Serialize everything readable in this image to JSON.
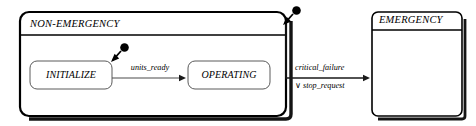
{
  "diagram": {
    "kind": "statechart",
    "background": "#ffffff",
    "line_color": "#000000",
    "shadow_color": "#1a1a1a",
    "states": [
      {
        "id": "non-emergency",
        "name": "NON-EMERGENCY",
        "kind": "composite",
        "x": 20,
        "y": 12,
        "width": 266,
        "height": 104,
        "corner_radius": 9,
        "title_divider_y": 35,
        "shadow": true,
        "border_width": 2.2
      },
      {
        "id": "initialize",
        "name": "INITIALIZE",
        "kind": "simple",
        "x": 30,
        "y": 61,
        "width": 82,
        "height": 28,
        "corner_radius": 7,
        "shadow": true,
        "border_width": 1
      },
      {
        "id": "operating",
        "name": "OPERATING",
        "kind": "simple",
        "x": 188,
        "y": 61,
        "width": 82,
        "height": 28,
        "corner_radius": 7,
        "shadow": true,
        "border_width": 1
      },
      {
        "id": "emergency",
        "name": "EMERGENCY",
        "kind": "composite",
        "x": 372,
        "y": 12,
        "width": 90,
        "height": 104,
        "corner_radius": 6,
        "title_divider_y": 30,
        "shadow": true,
        "border_width": 1.6
      }
    ],
    "initial_pseudostates": [
      {
        "id": "initial-top",
        "owner": "non-emergency",
        "circle_cx": 296,
        "circle_cy": 11,
        "circle_r": 4.2,
        "stub_x1": 292,
        "stub_y1": 15,
        "stub_x2": 283,
        "stub_y2": 24
      },
      {
        "id": "initial-inner",
        "owner": "initialize",
        "circle_cx": 124,
        "circle_cy": 48,
        "circle_r": 4.2,
        "stub_x1": 120,
        "stub_y1": 52,
        "stub_x2": 111,
        "stub_y2": 61
      }
    ],
    "transitions": [
      {
        "id": "units-ready",
        "source": "initialize",
        "target": "operating",
        "label": "units_ready",
        "label_x": 150,
        "label_y": 68,
        "path": "M 112 78 L 185 78",
        "arrow_x": 186,
        "arrow_y": 78,
        "arrow_dir": "right"
      },
      {
        "id": "critical-failure",
        "source": "non-emergency",
        "target": "emergency",
        "label_line1": "critical_failure",
        "label_line2": "∨ stop_request",
        "label1_x": 297,
        "label1_y": 68,
        "label2_x": 297,
        "label2_y": 86,
        "path": "M 286 24 L 286 78 L 369 78",
        "arrow_x": 370,
        "arrow_y": 78,
        "arrow_dir": "right"
      }
    ]
  }
}
